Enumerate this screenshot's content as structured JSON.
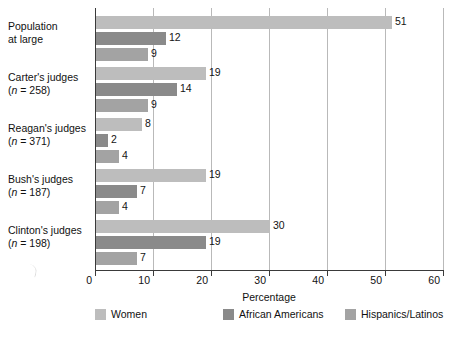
{
  "chart_data": {
    "type": "bar",
    "orientation": "horizontal",
    "title": "",
    "xlabel": "Percentage",
    "ylabel": "",
    "xlim": [
      0,
      60
    ],
    "xticks": [
      0,
      10,
      20,
      30,
      40,
      50,
      60
    ],
    "grid": true,
    "legend_position": "bottom",
    "categories": [
      "Population at large",
      "Carter's judges",
      "Reagan's judges",
      "Bush's judges",
      "Clinton's judges"
    ],
    "category_notes": [
      "",
      "(n = 258)",
      "(n = 371)",
      "(n = 187)",
      "(n = 198)"
    ],
    "series": [
      {
        "name": "Women",
        "color": "#bdbdbd",
        "values": [
          51,
          19,
          8,
          19,
          30
        ]
      },
      {
        "name": "African Americans",
        "color": "#8a8a8a",
        "values": [
          12,
          14,
          2,
          7,
          19
        ]
      },
      {
        "name": "Hispanics/Latinos",
        "color": "#a3a3a3",
        "values": [
          9,
          9,
          4,
          4,
          7
        ]
      }
    ]
  },
  "groups": [
    {
      "label_line1": "Population",
      "label_line2": "at large",
      "note": "",
      "bars": [
        {
          "series": "Women",
          "value": 51,
          "label": "51"
        },
        {
          "series": "African Americans",
          "value": 12,
          "label": "12"
        },
        {
          "series": "Hispanics/Latinos",
          "value": 9,
          "label": "9"
        }
      ]
    },
    {
      "label_line1": "Carter's judges",
      "label_line2": "",
      "note": "(n = 258)",
      "note_n": "n",
      "note_rest": " = 258)",
      "bars": [
        {
          "series": "Women",
          "value": 19,
          "label": "19"
        },
        {
          "series": "African Americans",
          "value": 14,
          "label": "14"
        },
        {
          "series": "Hispanics/Latinos",
          "value": 9,
          "label": "9"
        }
      ]
    },
    {
      "label_line1": "Reagan's judges",
      "label_line2": "",
      "note": "(n = 371)",
      "note_n": "n",
      "note_rest": " = 371)",
      "bars": [
        {
          "series": "Women",
          "value": 8,
          "label": "8"
        },
        {
          "series": "African Americans",
          "value": 2,
          "label": "2"
        },
        {
          "series": "Hispanics/Latinos",
          "value": 4,
          "label": "4"
        }
      ]
    },
    {
      "label_line1": "Bush's judges",
      "label_line2": "",
      "note": "(n = 187)",
      "note_n": "n",
      "note_rest": " = 187)",
      "bars": [
        {
          "series": "Women",
          "value": 19,
          "label": "19"
        },
        {
          "series": "African Americans",
          "value": 7,
          "label": "7"
        },
        {
          "series": "Hispanics/Latinos",
          "value": 4,
          "label": "4"
        }
      ]
    },
    {
      "label_line1": "Clinton's judges",
      "label_line2": "",
      "note": "(n = 198)",
      "note_n": "n",
      "note_rest": " = 198)",
      "bars": [
        {
          "series": "Women",
          "value": 30,
          "label": "30"
        },
        {
          "series": "African Americans",
          "value": 19,
          "label": "19"
        },
        {
          "series": "Hispanics/Latinos",
          "value": 7,
          "label": "7"
        }
      ]
    }
  ],
  "axis": {
    "title": "Percentage",
    "ticks": [
      {
        "value": 0,
        "label": "0"
      },
      {
        "value": 10,
        "label": "10"
      },
      {
        "value": 20,
        "label": "20"
      },
      {
        "value": 30,
        "label": "30"
      },
      {
        "value": 40,
        "label": "40"
      },
      {
        "value": 50,
        "label": "50"
      },
      {
        "value": 60,
        "label": "60"
      }
    ]
  },
  "legend": {
    "items": [
      {
        "label": "Women",
        "color": "#bdbdbd"
      },
      {
        "label": "African Americans",
        "color": "#8a8a8a"
      },
      {
        "label": "Hispanics/Latinos",
        "color": "#a3a3a3"
      }
    ]
  },
  "colors": {
    "women": "#bdbdbd",
    "african_americans": "#8a8a8a",
    "hispanics_latinos": "#a3a3a3",
    "axis": "#3a3a3a",
    "grid": "#b9b9b9",
    "text": "#111111",
    "background": "#ffffff"
  }
}
